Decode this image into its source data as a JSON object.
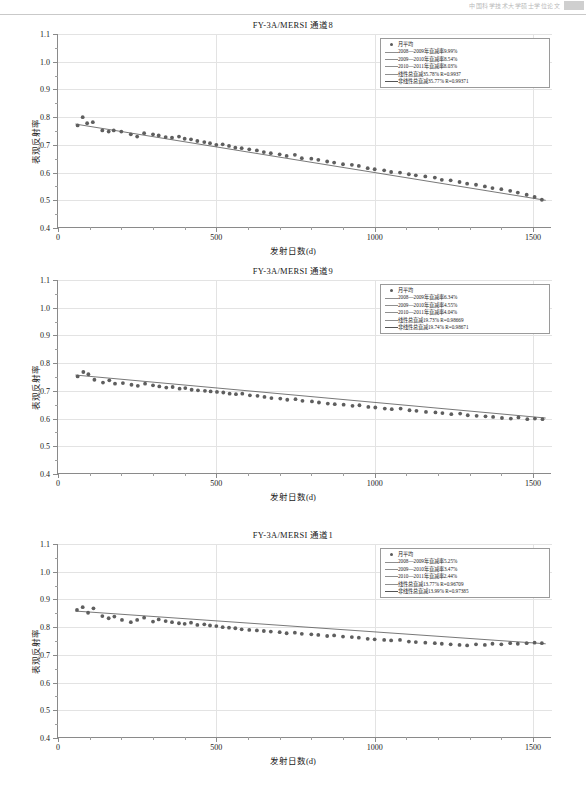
{
  "header": {
    "text": "中国科学技术大学硕士学位论文"
  },
  "axis": {
    "y_title": "表观反射率",
    "x_title": "发射日数(d)",
    "y_ticks": [
      "0.4",
      "0.5",
      "0.6",
      "0.7",
      "0.8",
      "0.9",
      "1.0",
      "1.1"
    ],
    "x_ticks": [
      "0",
      "500",
      "1000",
      "1500"
    ]
  },
  "chart_data": [
    {
      "type": "scatter",
      "title": "FY-3A/MERSI 通道8",
      "xlabel": "发射日数(d)",
      "ylabel": "表观反射率",
      "xlim": [
        0,
        1560
      ],
      "ylim": [
        0.4,
        1.1
      ],
      "legend_position": "top-right",
      "grid": true,
      "legend": [
        {
          "symbol": "dot",
          "label": "月平均"
        },
        {
          "symbol": "line",
          "label": "2008—2009年衰减率9.99%"
        },
        {
          "symbol": "line",
          "label": "2009—2010年衰减率8.54%"
        },
        {
          "symbol": "line",
          "label": "2010—2011年衰减率8.03%"
        },
        {
          "symbol": "line",
          "label": "线性总衰减35.78%  R=0.9937"
        },
        {
          "symbol": "line-solid",
          "label": "非线性总衰减35.77%  R=0.99371"
        }
      ],
      "series": [
        {
          "name": "月平均",
          "x": [
            62,
            78,
            92,
            110,
            140,
            160,
            176,
            200,
            230,
            250,
            272,
            300,
            318,
            340,
            360,
            382,
            400,
            420,
            440,
            462,
            480,
            500,
            520,
            540,
            560,
            580,
            604,
            628,
            650,
            672,
            700,
            722,
            748,
            770,
            800,
            822,
            850,
            872,
            900,
            928,
            950,
            978,
            1000,
            1030,
            1052,
            1080,
            1108,
            1130,
            1160,
            1190,
            1212,
            1240,
            1268,
            1292,
            1320,
            1348,
            1372,
            1400,
            1428,
            1452,
            1480,
            1505,
            1528
          ],
          "y": [
            0.77,
            0.8,
            0.778,
            0.782,
            0.752,
            0.748,
            0.752,
            0.748,
            0.738,
            0.73,
            0.742,
            0.738,
            0.734,
            0.728,
            0.726,
            0.73,
            0.722,
            0.72,
            0.714,
            0.71,
            0.706,
            0.7,
            0.702,
            0.696,
            0.69,
            0.688,
            0.684,
            0.68,
            0.674,
            0.67,
            0.666,
            0.66,
            0.664,
            0.652,
            0.65,
            0.646,
            0.64,
            0.636,
            0.63,
            0.628,
            0.624,
            0.616,
            0.612,
            0.608,
            0.602,
            0.6,
            0.594,
            0.59,
            0.586,
            0.582,
            0.574,
            0.572,
            0.566,
            0.56,
            0.556,
            0.55,
            0.544,
            0.54,
            0.534,
            0.528,
            0.52,
            0.512,
            0.502
          ]
        }
      ],
      "fit_line": {
        "x": [
          55,
          1540
        ],
        "y": [
          0.775,
          0.5
        ]
      }
    },
    {
      "type": "scatter",
      "title": "FY-3A/MERSI 通道9",
      "xlabel": "发射日数(d)",
      "ylabel": "表观反射率",
      "xlim": [
        0,
        1560
      ],
      "ylim": [
        0.4,
        1.1
      ],
      "legend_position": "top-right",
      "grid": true,
      "legend": [
        {
          "symbol": "dot",
          "label": "月平均"
        },
        {
          "symbol": "line",
          "label": "2008—2009年衰减率6.34%"
        },
        {
          "symbol": "line",
          "label": "2009—2010年衰减率4.55%"
        },
        {
          "symbol": "line",
          "label": "2010—2011年衰减率4.04%"
        },
        {
          "symbol": "line",
          "label": "线性总衰减19.73%  R=0.98669"
        },
        {
          "symbol": "line-solid",
          "label": "非线性总衰减19.74%  R=0.98671"
        }
      ],
      "series": [
        {
          "name": "月平均",
          "x": [
            62,
            80,
            96,
            115,
            142,
            162,
            180,
            205,
            232,
            252,
            275,
            300,
            320,
            342,
            362,
            384,
            402,
            422,
            442,
            464,
            482,
            502,
            522,
            542,
            562,
            582,
            606,
            630,
            652,
            674,
            702,
            724,
            750,
            772,
            802,
            824,
            852,
            874,
            902,
            930,
            952,
            980,
            1002,
            1032,
            1054,
            1082,
            1110,
            1132,
            1162,
            1192,
            1214,
            1242,
            1270,
            1294,
            1322,
            1350,
            1374,
            1402,
            1430,
            1454,
            1482,
            1506,
            1530
          ],
          "y": [
            0.752,
            0.768,
            0.76,
            0.74,
            0.73,
            0.738,
            0.726,
            0.728,
            0.722,
            0.718,
            0.726,
            0.72,
            0.716,
            0.712,
            0.714,
            0.708,
            0.71,
            0.704,
            0.702,
            0.7,
            0.698,
            0.696,
            0.694,
            0.69,
            0.688,
            0.69,
            0.684,
            0.682,
            0.678,
            0.674,
            0.672,
            0.668,
            0.67,
            0.664,
            0.662,
            0.658,
            0.654,
            0.652,
            0.65,
            0.646,
            0.648,
            0.642,
            0.64,
            0.636,
            0.634,
            0.636,
            0.63,
            0.628,
            0.624,
            0.622,
            0.62,
            0.616,
            0.618,
            0.612,
            0.61,
            0.608,
            0.606,
            0.602,
            0.6,
            0.604,
            0.598,
            0.6,
            0.598
          ]
        }
      ],
      "fit_line": {
        "x": [
          55,
          1540
        ],
        "y": [
          0.757,
          0.602
        ]
      }
    },
    {
      "type": "scatter",
      "title": "FY-3A/MERSI 通道1",
      "xlabel": "发射日数(d)",
      "ylabel": "表观反射率",
      "xlim": [
        0,
        1560
      ],
      "ylim": [
        0.4,
        1.1
      ],
      "legend_position": "top-right",
      "grid": true,
      "legend": [
        {
          "symbol": "dot",
          "label": "月平均"
        },
        {
          "symbol": "line",
          "label": "2008—2009年衰减率5.25%"
        },
        {
          "symbol": "line",
          "label": "2009—2010年衰减率3.47%"
        },
        {
          "symbol": "line",
          "label": "2010—2011年衰减率2.44%"
        },
        {
          "symbol": "line",
          "label": "线性总衰减13.77%  R=0.96709"
        },
        {
          "symbol": "line-solid",
          "label": "非线性总衰减13.99%  R=0.97385"
        }
      ],
      "series": [
        {
          "name": "月平均",
          "x": [
            60,
            78,
            95,
            112,
            140,
            160,
            178,
            202,
            230,
            250,
            272,
            300,
            318,
            340,
            360,
            382,
            400,
            420,
            440,
            462,
            480,
            500,
            520,
            540,
            560,
            580,
            604,
            628,
            650,
            672,
            700,
            722,
            748,
            770,
            800,
            822,
            850,
            872,
            900,
            928,
            950,
            978,
            1000,
            1030,
            1052,
            1080,
            1108,
            1130,
            1160,
            1190,
            1212,
            1240,
            1268,
            1292,
            1320,
            1348,
            1372,
            1400,
            1428,
            1452,
            1480,
            1505,
            1528
          ],
          "y": [
            0.862,
            0.872,
            0.852,
            0.868,
            0.84,
            0.832,
            0.838,
            0.826,
            0.818,
            0.826,
            0.834,
            0.82,
            0.828,
            0.822,
            0.818,
            0.814,
            0.812,
            0.816,
            0.808,
            0.81,
            0.806,
            0.804,
            0.8,
            0.798,
            0.796,
            0.792,
            0.79,
            0.788,
            0.786,
            0.784,
            0.782,
            0.778,
            0.78,
            0.776,
            0.774,
            0.772,
            0.768,
            0.77,
            0.766,
            0.764,
            0.762,
            0.758,
            0.756,
            0.754,
            0.752,
            0.754,
            0.748,
            0.746,
            0.744,
            0.742,
            0.74,
            0.738,
            0.736,
            0.734,
            0.738,
            0.736,
            0.74,
            0.738,
            0.742,
            0.74,
            0.742,
            0.744,
            0.742
          ]
        }
      ],
      "fit_line": {
        "x": [
          55,
          1540
        ],
        "y": [
          0.858,
          0.74
        ]
      }
    }
  ]
}
